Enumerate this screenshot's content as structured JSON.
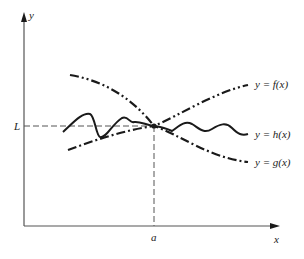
{
  "diagram": {
    "type": "squeeze-theorem-graph",
    "axes": {
      "x_label": "x",
      "y_label": "y"
    },
    "markers": {
      "x_point": "a",
      "y_point": "L"
    },
    "curves": [
      {
        "id": "f",
        "label": "y = f(x)",
        "style": "dash-dot-dot"
      },
      {
        "id": "h",
        "label": "y = h(x)",
        "style": "solid-wavy"
      },
      {
        "id": "g",
        "label": "y = g(x)",
        "style": "dash-dot"
      }
    ],
    "colors": {
      "ink": "#1a1a1a",
      "guide": "#555555",
      "background": "#ffffff"
    }
  }
}
